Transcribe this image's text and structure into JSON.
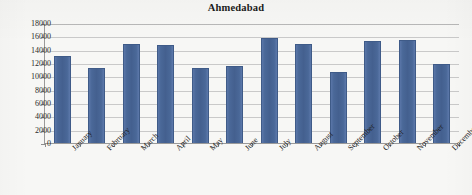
{
  "chart_data": {
    "type": "bar",
    "title": "Ahmedabad",
    "xlabel": "",
    "ylabel": "",
    "categories": [
      "January",
      "February",
      "March",
      "April",
      "May",
      "June",
      "July",
      "August",
      "September",
      "October",
      "November",
      "December"
    ],
    "values": [
      13000,
      11200,
      14800,
      14750,
      11300,
      11600,
      15700,
      14800,
      10700,
      15350,
      15400,
      11900
    ],
    "ylim": [
      0,
      18000
    ],
    "ytick_step": 2000,
    "ytick_labels": [
      "18000",
      "16000",
      "14000",
      "12000",
      "10000",
      "8000",
      "6000",
      "4000",
      "2000",
      "0"
    ],
    "ytick_values": [
      18000,
      16000,
      14000,
      12000,
      10000,
      8000,
      6000,
      4000,
      2000,
      0
    ],
    "grid": true,
    "grid_orientation": "horizontal",
    "legend": false,
    "legend_position": "none",
    "series_name": "Ahmedabad",
    "bar_color": "#4A6898",
    "bar_border_color": "#3F5B88",
    "grid_color": "#C9C9C9",
    "axis_color": "#9A9A9A",
    "background_color": "#F7F7F5",
    "xlabel_rotation": -45
  }
}
